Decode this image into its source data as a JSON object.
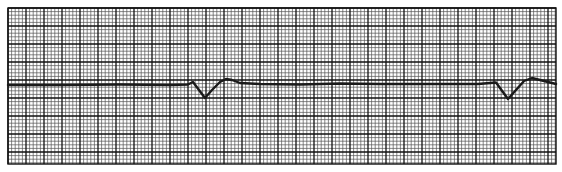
{
  "chart_data": {
    "type": "line",
    "title": "",
    "xlabel": "",
    "ylabel": "",
    "grid": {
      "on": true,
      "major_spacing_px": 18,
      "minor_per_major": 5,
      "left": 8,
      "top": 8,
      "right": 556,
      "bottom": 164,
      "minor_color": "#555555",
      "major_color": "#111111"
    },
    "trace_color": "#1a1a1a",
    "series": [
      {
        "name": "ECG lead",
        "points": [
          [
            8,
            85
          ],
          [
            60,
            85
          ],
          [
            120,
            84.5
          ],
          [
            170,
            85
          ],
          [
            188,
            84.5
          ],
          [
            193,
            82
          ],
          [
            205,
            98
          ],
          [
            212,
            90
          ],
          [
            220,
            82
          ],
          [
            226,
            79
          ],
          [
            232,
            80
          ],
          [
            240,
            83
          ],
          [
            260,
            84
          ],
          [
            300,
            84.5
          ],
          [
            340,
            83.5
          ],
          [
            380,
            84
          ],
          [
            430,
            84
          ],
          [
            478,
            84
          ],
          [
            496,
            82.5
          ],
          [
            508,
            99
          ],
          [
            516,
            90
          ],
          [
            524,
            81
          ],
          [
            532,
            78
          ],
          [
            540,
            80
          ],
          [
            548,
            82
          ],
          [
            556,
            84
          ]
        ]
      }
    ],
    "annotations": []
  }
}
